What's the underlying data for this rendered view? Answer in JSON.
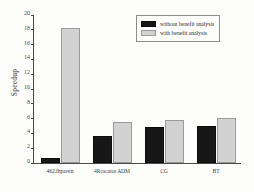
{
  "chart_data": {
    "type": "bar",
    "title": "",
    "xlabel": "",
    "ylabel": "Speedup",
    "ylim": [
      0,
      20
    ],
    "yticks": [
      0,
      2,
      4,
      6,
      8,
      10,
      12,
      14,
      16,
      18,
      20
    ],
    "grid": false,
    "legend_position": "top-right",
    "categories": [
      "462.fhparstn",
      "4Rcacatos ADM",
      "CG",
      "BT"
    ],
    "series": [
      {
        "name": "without benefit analysis",
        "color": "#171717",
        "values": [
          0.7,
          3.6,
          4.8,
          5.0
        ]
      },
      {
        "name": "with benefit analysis",
        "color": "#d2d2d2",
        "values": [
          18.2,
          5.6,
          5.8,
          6.1
        ]
      }
    ]
  },
  "legend": {
    "entries": [
      {
        "label": "without benefit analysis",
        "swatch": "dark"
      },
      {
        "label": "with benefit analysis",
        "swatch": "light"
      }
    ]
  },
  "axis": {
    "y_title": "Speedup"
  }
}
